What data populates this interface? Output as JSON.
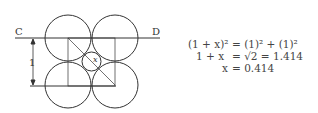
{
  "diagram": {
    "labels": {
      "left_point": "C",
      "right_point": "D",
      "dimension": "1",
      "small_circle": "x"
    }
  },
  "equations": [
    {
      "lhs": "(1 + x)²",
      "rhs": "= (1)² + (1)²"
    },
    {
      "lhs": "1 + x",
      "rhs": "= √2 = 1.414"
    },
    {
      "lhs": "x",
      "rhs": "= 0.414"
    }
  ]
}
